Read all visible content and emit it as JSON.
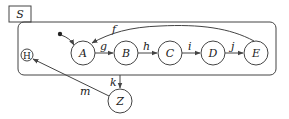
{
  "diagram": {
    "type": "statechart",
    "container": {
      "label": "S"
    },
    "nodes": [
      {
        "id": "A",
        "label": "A"
      },
      {
        "id": "B",
        "label": "B"
      },
      {
        "id": "C",
        "label": "C"
      },
      {
        "id": "D",
        "label": "D"
      },
      {
        "id": "E",
        "label": "E"
      },
      {
        "id": "H",
        "label": "H",
        "kind": "history"
      },
      {
        "id": "Z",
        "label": "Z"
      }
    ],
    "edges": [
      {
        "from": "initial",
        "to": "A",
        "label": ""
      },
      {
        "from": "A",
        "to": "B",
        "label": "g"
      },
      {
        "from": "B",
        "to": "C",
        "label": "h"
      },
      {
        "from": "C",
        "to": "D",
        "label": "i"
      },
      {
        "from": "D",
        "to": "E",
        "label": "j"
      },
      {
        "from": "E",
        "to": "A",
        "label": "f"
      },
      {
        "from": "S",
        "to": "Z",
        "label": "k"
      },
      {
        "from": "Z",
        "to": "H",
        "label": "m"
      }
    ]
  }
}
